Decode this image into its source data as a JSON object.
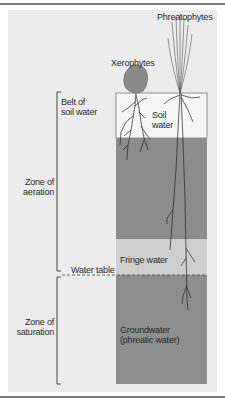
{
  "diagram": {
    "type": "soil-water zones cross-section",
    "plants": {
      "xerophytes": "Xerophytes",
      "phreatophytes": "Phreatophytes"
    },
    "column_layers": {
      "soil_water": "Soil\nwater",
      "fringe_water": "Fringe water",
      "groundwater": "Groundwater\n(phreatic water)"
    },
    "left_labels": {
      "belt_of_soil_water": "Belt of\nsoil water",
      "zone_of_aeration": "Zone of\naeration",
      "water_table": "Water table",
      "zone_of_saturation": "Zone of\nsaturation"
    },
    "colors": {
      "background_panel": "#ececec",
      "soil_water": "#f6f6f6",
      "intermediate_zone": "#8c8c8c",
      "fringe_water": "#cfcfcf",
      "groundwater": "#8e8e8e",
      "xerophyte_canopy": "#8a8a8a",
      "lines": "#333333"
    }
  }
}
